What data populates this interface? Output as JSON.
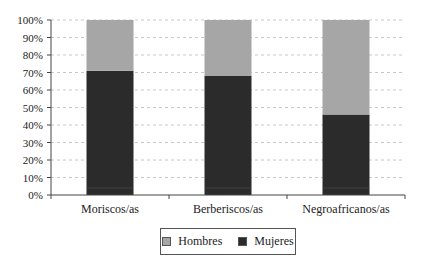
{
  "chart_data": {
    "type": "bar",
    "stacked": true,
    "normalized": true,
    "title": "",
    "xlabel": "",
    "ylabel": "",
    "ylim": [
      0,
      100
    ],
    "yticks": [
      "0%",
      "10%",
      "20%",
      "30%",
      "40%",
      "50%",
      "60%",
      "70%",
      "80%",
      "90%",
      "100%"
    ],
    "grid": "horizontal dashed",
    "legend_position": "bottom",
    "categories": [
      "Moriscos/as",
      "Berberiscos/as",
      "Negroafricanos/as"
    ],
    "series": [
      {
        "name": "Mujeres",
        "color": "#2b2b2b",
        "values": [
          71,
          68,
          46
        ]
      },
      {
        "name": "Hombres",
        "color": "#a6a6a6",
        "values": [
          29,
          32,
          54
        ]
      }
    ]
  },
  "legend": {
    "items": [
      {
        "label": "Hombres",
        "color": "#a6a6a6"
      },
      {
        "label": "Mujeres",
        "color": "#2b2b2b"
      }
    ]
  }
}
